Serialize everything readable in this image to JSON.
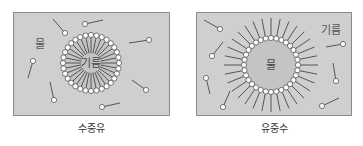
{
  "colors": {
    "panel_bg": "#cfcfcf",
    "inner_bg": "#c4c4c4",
    "border": "#8a8a8a",
    "line": "#555555",
    "head": "#ffffff"
  },
  "left": {
    "caption": "수중유",
    "outer_label": "물",
    "inner_label": "기름"
  },
  "right": {
    "caption": "유중수",
    "outer_label": "기름",
    "inner_label": "물"
  }
}
